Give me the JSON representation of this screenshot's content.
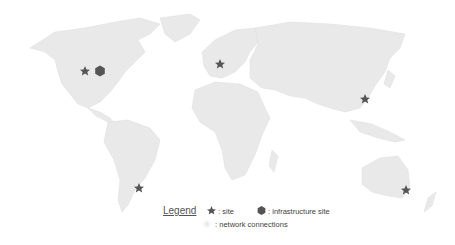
{
  "map": {
    "land_color": "#e9e9e9",
    "marker_color": "#555555",
    "markers": [
      {
        "type": "site",
        "label": "site",
        "x": 85,
        "y": 71
      },
      {
        "type": "infrastructure",
        "label": "infrastructure site",
        "x": 100,
        "y": 71
      },
      {
        "type": "site",
        "label": "site",
        "x": 220,
        "y": 64
      },
      {
        "type": "site",
        "label": "site",
        "x": 365,
        "y": 99
      },
      {
        "type": "site",
        "label": "site",
        "x": 139,
        "y": 188
      },
      {
        "type": "site",
        "label": "site",
        "x": 406,
        "y": 190
      }
    ]
  },
  "legend": {
    "title": "Legend",
    "items": [
      {
        "icon": "star-icon",
        "label": ": site"
      },
      {
        "icon": "hexagon-icon",
        "label": ": infrastructure site"
      },
      {
        "icon": "glow-icon",
        "label": ": network connections"
      }
    ]
  }
}
